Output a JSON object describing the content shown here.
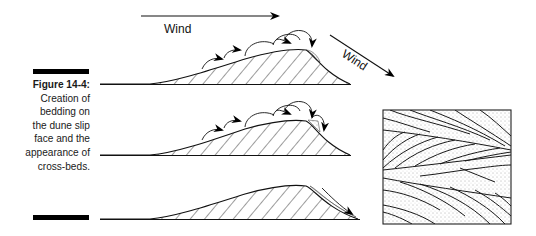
{
  "figure": {
    "label": "Figure 14-4:",
    "caption": "Creation of bedding on the dune slip face and the appearance of cross-beds."
  },
  "diagram": {
    "wind_label_top": "Wind",
    "wind_label_diagonal": "Wind",
    "panels": [
      {
        "name": "dune-1",
        "description": "Sand saltation up stoss side, avalanching over crest"
      },
      {
        "name": "dune-2",
        "description": "Continued saltation with avalanche onto slip face"
      },
      {
        "name": "dune-3",
        "description": "Slip face bedding formed"
      }
    ],
    "block": {
      "name": "cross-bed-block",
      "description": "Cross-section showing cross-beds"
    }
  }
}
